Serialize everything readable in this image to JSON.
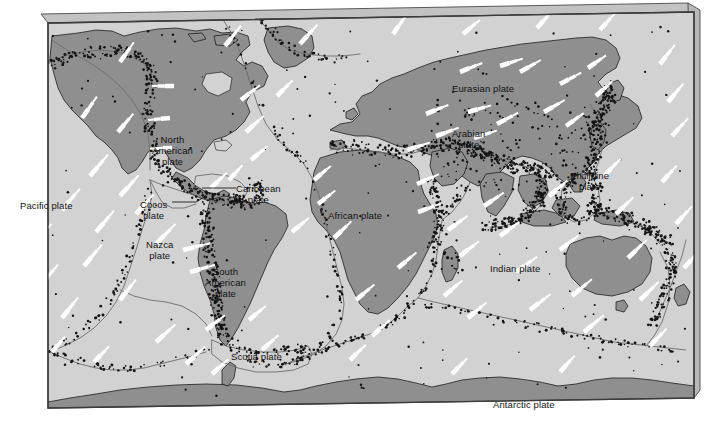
{
  "figure": {
    "kind": "world-tectonic-plate-map"
  },
  "colors": {
    "ocean": "#d2d2d2",
    "continent": "#8f8f8f",
    "continent_light": "#b0b0b0",
    "frame_top_bevel": "#c2c2c2",
    "frame_side_bevel": "#b5b5b5",
    "frame_line": "#4a4a4a",
    "boundary_line": "#6d6d6d",
    "epicenter_dot": "#141414",
    "motion_arrow": "#ffffff",
    "label_text": "#121212",
    "page_background": "#ffffff"
  },
  "labels": [
    {
      "name": "pacific-plate",
      "text": "Pacific plate",
      "x": 20,
      "y": 200,
      "align": "left"
    },
    {
      "name": "cocos-plate",
      "text": "Cocos\nplate",
      "x": 140,
      "y": 199,
      "align": "center"
    },
    {
      "name": "north-american-plate",
      "text": "North\nAmerican\nplate",
      "x": 152,
      "y": 134,
      "align": "center"
    },
    {
      "name": "caribbean-plate",
      "text": "Caribbean\nplate",
      "x": 236,
      "y": 183,
      "align": "center"
    },
    {
      "name": "nazca-plate",
      "text": "Nazca\nplate",
      "x": 146,
      "y": 239,
      "align": "center"
    },
    {
      "name": "south-american-plate",
      "text": "South\nAmerican\nplate",
      "x": 205,
      "y": 266,
      "align": "center"
    },
    {
      "name": "scotia-plate",
      "text": "Scotia plate",
      "x": 231,
      "y": 351,
      "align": "left"
    },
    {
      "name": "african-plate",
      "text": "African plate",
      "x": 328,
      "y": 210,
      "align": "left"
    },
    {
      "name": "eurasian-plate",
      "text": "Eurasian plate",
      "x": 452,
      "y": 83,
      "align": "left"
    },
    {
      "name": "arabian-plate",
      "text": "Arabian\nplate",
      "x": 452,
      "y": 128,
      "align": "center"
    },
    {
      "name": "phillipine-plate",
      "text": "Phillipine\nplate",
      "x": 570,
      "y": 170,
      "align": "center"
    },
    {
      "name": "indian-plate",
      "text": "Indian plate",
      "x": 490,
      "y": 263,
      "align": "left"
    },
    {
      "name": "antarctic-plate",
      "text": "Antarctic plate",
      "x": 493,
      "y": 399,
      "align": "left"
    }
  ],
  "legend_note": {
    "epicenters": "black dots = earthquake epicentres",
    "arrows": "white arrows = relative plate motion direction",
    "thin_lines": "grey lines = plate boundaries"
  }
}
